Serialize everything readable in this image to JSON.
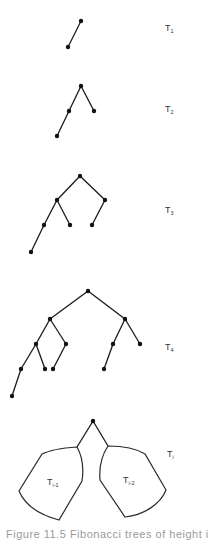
{
  "figure": {
    "trees": [
      {
        "label": "T",
        "sub": "1",
        "label_pos": [
          165,
          31
        ],
        "nodes": [
          [
            81,
            21
          ],
          [
            68,
            47
          ]
        ],
        "edges": [
          [
            0,
            1
          ]
        ]
      },
      {
        "label": "T",
        "sub": "2",
        "label_pos": [
          165,
          112
        ],
        "nodes": [
          [
            81,
            86
          ],
          [
            69,
            111
          ],
          [
            94,
            111
          ],
          [
            57,
            136
          ]
        ],
        "edges": [
          [
            0,
            1
          ],
          [
            0,
            2
          ],
          [
            1,
            3
          ]
        ]
      },
      {
        "label": "T",
        "sub": "3",
        "label_pos": [
          165,
          213
        ],
        "nodes": [
          [
            80,
            176
          ],
          [
            57,
            200
          ],
          [
            105,
            200
          ],
          [
            44,
            225
          ],
          [
            70,
            225
          ],
          [
            92,
            225
          ],
          [
            31,
            252
          ]
        ],
        "edges": [
          [
            0,
            1
          ],
          [
            0,
            2
          ],
          [
            1,
            3
          ],
          [
            1,
            4
          ],
          [
            2,
            5
          ],
          [
            3,
            6
          ]
        ]
      },
      {
        "label": "T",
        "sub": "4",
        "label_pos": [
          165,
          350
        ],
        "nodes": [
          [
            88,
            291
          ],
          [
            50,
            319
          ],
          [
            125,
            319
          ],
          [
            36,
            344
          ],
          [
            66,
            344
          ],
          [
            113,
            344
          ],
          [
            140,
            344
          ],
          [
            21,
            369
          ],
          [
            45,
            369
          ],
          [
            53,
            369
          ],
          [
            104,
            369
          ],
          [
            12,
            396
          ]
        ],
        "edges": [
          [
            0,
            1
          ],
          [
            0,
            2
          ],
          [
            1,
            3
          ],
          [
            1,
            4
          ],
          [
            2,
            5
          ],
          [
            2,
            6
          ],
          [
            3,
            7
          ],
          [
            3,
            8
          ],
          [
            4,
            9
          ],
          [
            5,
            10
          ],
          [
            7,
            11
          ]
        ]
      }
    ],
    "general_tree": {
      "label": "T",
      "sub": "i",
      "label_pos": [
        167,
        457
      ],
      "root": [
        93,
        421
      ],
      "left_subtree": {
        "label": "T",
        "sub": "i-1",
        "label_pos": [
          47,
          485
        ]
      },
      "right_subtree": {
        "label": "T",
        "sub": "i-2",
        "label_pos": [
          123,
          483
        ]
      }
    },
    "caption": "Figure 11.5  Fibonacci trees of height i"
  }
}
